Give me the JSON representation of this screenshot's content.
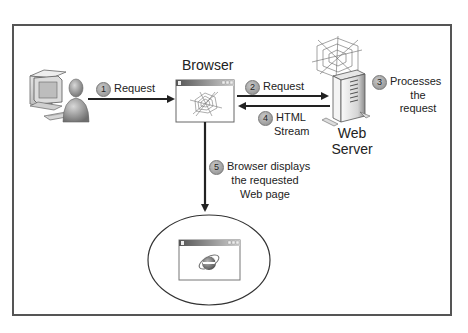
{
  "diagram": {
    "nodes": {
      "client": {
        "label": "",
        "icon": "user-computer-icon"
      },
      "browser": {
        "label": "Browser",
        "icon": "browser-window-web-icon"
      },
      "web_server": {
        "label_line1": "Web",
        "label_line2": "Server",
        "icon": "server-tower-web-icon"
      },
      "displayed_page": {
        "label": "",
        "icon": "browser-window-ie-icon"
      }
    },
    "steps": [
      {
        "number": "1",
        "text": "Request"
      },
      {
        "number": "2",
        "text": "Request"
      },
      {
        "number": "3",
        "line1": "Processes",
        "line2": "the",
        "line3": "request"
      },
      {
        "number": "4",
        "line1": "HTML",
        "line2": "Stream"
      },
      {
        "number": "5",
        "line1": "Browser displays",
        "line2": "the requested",
        "line3": "Web page"
      }
    ],
    "edges": [
      {
        "from": "client",
        "to": "browser",
        "step": "1"
      },
      {
        "from": "browser",
        "to": "web_server",
        "step": "2"
      },
      {
        "from": "web_server",
        "to": "browser",
        "step": "4"
      },
      {
        "from": "browser",
        "to": "displayed_page",
        "step": "5"
      }
    ],
    "colors": {
      "frame": "#555555",
      "arrow": "#222222",
      "badge": "#a0a0a0"
    }
  }
}
